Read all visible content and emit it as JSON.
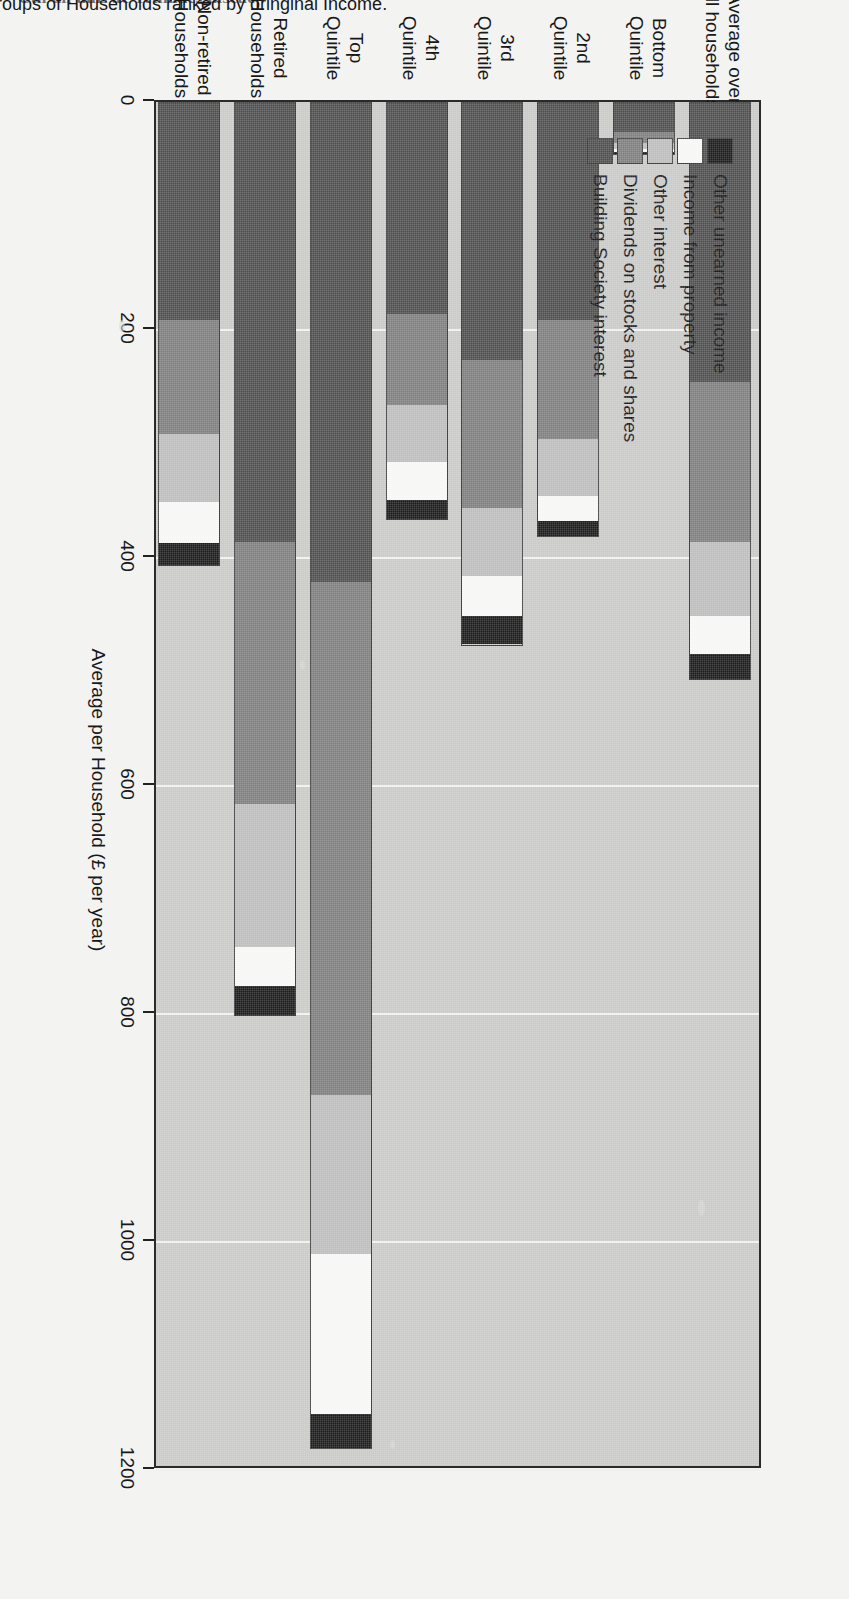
{
  "clipped_header": "Ctil ull uuL   uc Tctiiuucs uiscuc",
  "chart_data": {
    "type": "bar",
    "orientation": "vertical-stacked",
    "title": "",
    "xlabel": "Quintile groups of Households ranked by oringinal Income.",
    "ylabel": "Average per Household (£ per year)",
    "ylim": [
      0,
      1200
    ],
    "yticks": [
      0,
      200,
      400,
      600,
      800,
      1000,
      1200
    ],
    "ytick_labels": [
      "0",
      "200",
      "400",
      "600",
      "800",
      "1000",
      "1200"
    ],
    "grid": true,
    "legend_position": "upper-left-inside",
    "categories": [
      "Average over\nall households",
      "Bottom\nQuintile",
      "2nd\nQuintile",
      "3rd\nQuintile",
      "4th\nQuintile",
      "Top\nQuintile",
      "Retired\nHouseholds",
      "Non-retired\nHouseholds"
    ],
    "category_lines": [
      [
        "Average over",
        "all households"
      ],
      [
        "Bottom",
        "Quintile"
      ],
      [
        "2nd",
        "Quintile"
      ],
      [
        "3rd",
        "Quintile"
      ],
      [
        "4th",
        "Quintile"
      ],
      [
        "Top",
        "Quintile"
      ],
      [
        "Retired",
        "Households"
      ],
      [
        "Non-retired",
        "Households"
      ]
    ],
    "series": [
      {
        "name": "Building Society interest",
        "color": "#4f4f4f",
        "values": [
          245,
          25,
          190,
          225,
          185,
          420,
          385,
          190
        ]
      },
      {
        "name": "Dividends on stocks and shares",
        "color": "#7f7f7f",
        "values": [
          140,
          10,
          105,
          130,
          80,
          450,
          230,
          100
        ]
      },
      {
        "name": "Other interest",
        "color": "#bdbdbd",
        "values": [
          65,
          5,
          50,
          60,
          50,
          140,
          125,
          60
        ]
      },
      {
        "name": "Income from property",
        "color": "#f7f7f5",
        "values": [
          33,
          3,
          22,
          35,
          33,
          140,
          35,
          36
        ]
      },
      {
        "name": "Other unearned income",
        "color": "#1c1c1c",
        "values": [
          22,
          2,
          13,
          25,
          17,
          30,
          25,
          19
        ]
      }
    ],
    "totals": [
      505,
      45,
      380,
      475,
      365,
      1180,
      800,
      405
    ],
    "legend_entries": [
      "Other unearned income",
      "Income from property",
      "Other interest",
      "Dividends on stocks and shares",
      "Building Society interest"
    ],
    "legend_colors": [
      "#1c1c1c",
      "#f7f7f5",
      "#bdbdbd",
      "#7f7f7f",
      "#4f4f4f"
    ]
  }
}
